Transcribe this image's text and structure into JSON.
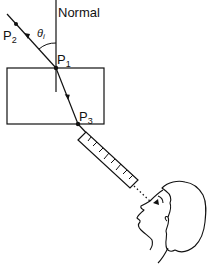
{
  "diagram": {
    "labels": {
      "normal": "Normal",
      "theta": "θ",
      "theta_sub": "i",
      "p1": "P",
      "p1_sub": "1",
      "p2": "P",
      "p2_sub": "2",
      "p3": "P",
      "p3_sub": "3"
    },
    "elements": [
      "normal-line",
      "incident-ray",
      "glass-block",
      "refracted-ray",
      "emergent-ray",
      "ruler",
      "dotted-sightline",
      "observer-head"
    ],
    "colors": {
      "stroke": "#111111",
      "background": "#ffffff"
    }
  }
}
